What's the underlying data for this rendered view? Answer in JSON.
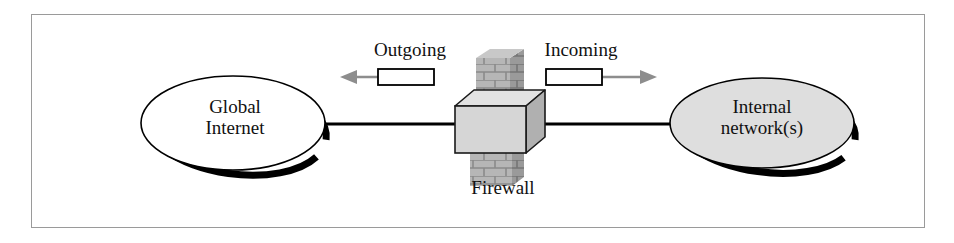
{
  "figure": {
    "name": "firewall-network-diagram",
    "frame_color": "#9a9a9a",
    "background_color": "#ffffff"
  },
  "nodes": {
    "left_cloud": {
      "label_line_1": "Global",
      "label_line_2": "Internet",
      "fill_color": "#ffffff",
      "stroke_color": "#000000",
      "shadow_color": "#000000"
    },
    "right_cloud": {
      "label_line_1": "Internal",
      "label_line_2": "network(s)",
      "fill_color": "#dedede",
      "stroke_color": "#000000",
      "shadow_color": "#000000"
    },
    "firewall": {
      "label": "Firewall",
      "wall_fill_color": "#b4b4b4",
      "wall_mortar_color": "#8a8a8a",
      "box_front_color": "#d6d6d6",
      "box_top_color": "#e2e2e2",
      "box_side_color": "#b0b0b0",
      "box_stroke_color": "#1a1a1a"
    }
  },
  "traffic": {
    "outgoing": {
      "label": "Outgoing",
      "direction": "left",
      "packet_fill_color": "#ffffff",
      "packet_stroke_color": "#000000",
      "arrow_color": "#8d8d8d"
    },
    "incoming": {
      "label": "Incoming",
      "direction": "right",
      "packet_fill_color": "#ffffff",
      "packet_stroke_color": "#000000",
      "arrow_color": "#8d8d8d"
    }
  },
  "connectors": {
    "left_link_color": "#000000",
    "right_link_color": "#000000"
  }
}
